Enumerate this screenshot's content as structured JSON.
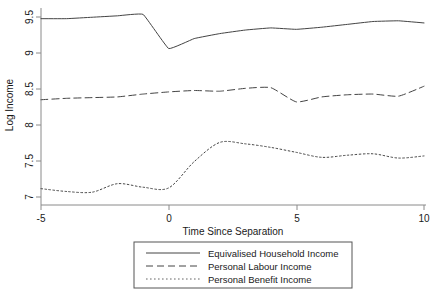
{
  "chart_data": {
    "type": "line",
    "title": "",
    "xlabel": "Time Since Separation",
    "ylabel": "Log Income",
    "xlim": [
      -5,
      10
    ],
    "ylim": [
      6.85,
      9.62
    ],
    "xticks": [
      -5,
      0,
      5,
      10
    ],
    "xtick_labels": [
      "-5",
      "0",
      "5",
      "10"
    ],
    "yticks": [
      7,
      7.5,
      8,
      8.5,
      9,
      9.5
    ],
    "ytick_labels": [
      "7",
      "7.5",
      "8",
      "8.5",
      "9",
      "9.5"
    ],
    "grid": false,
    "legend_position": "below-center",
    "x": [
      -5,
      -4,
      -3,
      -2,
      -1,
      0,
      1,
      2,
      3,
      4,
      5,
      6,
      7,
      8,
      9,
      10
    ],
    "series": [
      {
        "name": "Equivalised Household Income",
        "style": "solid",
        "color": "#444444",
        "values": [
          9.47,
          9.47,
          9.49,
          9.51,
          9.53,
          9.05,
          9.19,
          9.26,
          9.31,
          9.34,
          9.32,
          9.35,
          9.39,
          9.43,
          9.44,
          9.41
        ]
      },
      {
        "name": "Personal Labour Income",
        "style": "dashed",
        "color": "#444444",
        "values": [
          8.33,
          8.35,
          8.36,
          8.37,
          8.41,
          8.44,
          8.46,
          8.45,
          8.49,
          8.5,
          8.3,
          8.37,
          8.4,
          8.41,
          8.38,
          8.52
        ]
      },
      {
        "name": "Personal Benefit Income",
        "style": "dotted",
        "color": "#666666",
        "values": [
          7.08,
          7.04,
          7.03,
          7.15,
          7.1,
          7.09,
          7.46,
          7.73,
          7.71,
          7.66,
          7.59,
          7.52,
          7.55,
          7.57,
          7.51,
          7.54
        ]
      }
    ],
    "legend_entries": [
      {
        "label": "Equivalised Household Income",
        "style": "solid"
      },
      {
        "label": "Personal Labour Income",
        "style": "dashed"
      },
      {
        "label": "Personal Benefit Income",
        "style": "dotted"
      }
    ]
  }
}
